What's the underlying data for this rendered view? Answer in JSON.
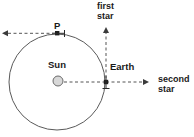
{
  "diagram": {
    "labels": {
      "first_star": "first\nstar",
      "second_star": "second\nstar",
      "sun": "Sun",
      "earth": "Earth",
      "point_p": "P"
    },
    "colors": {
      "stroke": "#4a4a4a",
      "dashed": "#555555",
      "text": "#1a1a1a",
      "sun_fill": "#d9d9d9",
      "background": "#ffffff"
    },
    "geometry": {
      "orbit_center_x": 57,
      "orbit_center_y": 82,
      "orbit_radius": 48,
      "sun_x": 58,
      "sun_y": 81,
      "sun_radius": 5,
      "earth_x": 106,
      "earth_y": 82,
      "point_p_x": 57,
      "point_p_y": 33,
      "first_star_arrow_tip_y": 27,
      "second_star_arrow_tip_x": 149,
      "p_arrow_tip_x": 2
    }
  }
}
